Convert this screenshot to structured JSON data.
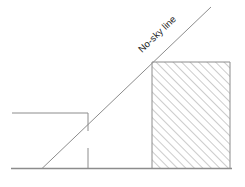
{
  "diagram": {
    "background_color": "#ffffff",
    "line_color": "#8c8c8c",
    "hatch_color": "#9a9a9a",
    "text_color": "#1c1c1c",
    "labels": {
      "no_sky_line": "No-sky line"
    },
    "elements": {
      "ground_line": {
        "name": "ground-line",
        "x1": 11,
        "y1": 168.5,
        "x2": 232,
        "y2": 168.5
      },
      "no_sky_line": {
        "name": "no-sky-line",
        "x1": 42,
        "y1": 168.5,
        "x2": 211,
        "y2": 7,
        "angle_degrees": -43.7
      },
      "existing_building": {
        "name": "existing-building-outline",
        "roof_y": 113,
        "left_x": 12,
        "right_x": 88,
        "wall_bottom_y": 131
      },
      "window_reference_mark": {
        "name": "window-reference-tick",
        "x": 88,
        "y_top": 148,
        "y_bottom": 168
      },
      "obstruction_block": {
        "name": "hatched-obstruction",
        "left_x": 152,
        "top_y": 62,
        "right_x": 230,
        "bottom_y": 168.5,
        "hatch_angle_degrees": 45,
        "hatch_spacing": 6
      }
    }
  }
}
